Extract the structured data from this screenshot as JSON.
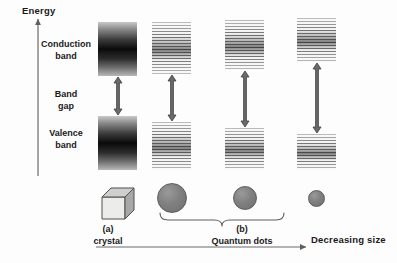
{
  "figure": {
    "background_color": "#fdfdfd",
    "width": 397,
    "height": 263
  },
  "axes": {
    "y_axis": {
      "label": "Energy",
      "direction": "up",
      "x": 38,
      "top": 18,
      "bottom": 176
    },
    "x_axis": {
      "label": "Decreasing size",
      "direction": "right",
      "y": 247,
      "left": 96,
      "right": 308
    }
  },
  "labels": {
    "conduction_band": "Conduction\nband",
    "conduction_band_line1": "Conduction",
    "conduction_band_line2": "band",
    "band_gap_line1": "Band",
    "band_gap_line2": "gap",
    "valence_band_line1": "Valence",
    "valence_band_line2": "band"
  },
  "captions": {
    "a_tag": "(a)",
    "a_text": "crystal",
    "b_tag": "(b)",
    "b_text": "Quantum dots"
  },
  "colors": {
    "band_dark": "#0a0a0a",
    "band_light": "#c9c9c9",
    "quantised_line": "#6f6f6f",
    "arrow": "#5a5a5a",
    "dot_fill": "#7b7b7b",
    "axis": "#6b6b6b",
    "text": "#1a1a1a"
  },
  "chart_data": {
    "type": "diagram",
    "xlabel": "Decreasing size",
    "ylabel": "Energy",
    "columns": [
      {
        "id": "crystal",
        "kind": "bulk-crystal",
        "caption_tag": "(a)",
        "caption_text": "crystal",
        "band_style": "continuous",
        "specimen": "cube",
        "specimen_size_px": 30,
        "conduction_band": {
          "x": 98,
          "y": 22,
          "width": 39,
          "height": 54
        },
        "valence_band": {
          "x": 98,
          "y": 116,
          "width": 39,
          "height": 54
        },
        "band_gap": {
          "top": 76,
          "bottom": 116,
          "height": 40,
          "relative": 1.0
        }
      },
      {
        "id": "qd-large",
        "kind": "quantum-dot",
        "band_style": "quantised",
        "specimen": "circle",
        "specimen_size_px": 30,
        "conduction_band": {
          "x": 152,
          "y": 22,
          "width": 39,
          "height": 52
        },
        "valence_band": {
          "x": 152,
          "y": 122,
          "width": 39,
          "height": 48
        },
        "band_gap": {
          "top": 74,
          "bottom": 122,
          "height": 48,
          "relative": 1.2
        }
      },
      {
        "id": "qd-medium",
        "kind": "quantum-dot",
        "band_style": "quantised",
        "specimen": "circle",
        "specimen_size_px": 24,
        "conduction_band": {
          "x": 225,
          "y": 20,
          "width": 39,
          "height": 50
        },
        "valence_band": {
          "x": 225,
          "y": 128,
          "width": 39,
          "height": 42
        },
        "band_gap": {
          "top": 70,
          "bottom": 128,
          "height": 58,
          "relative": 1.45
        }
      },
      {
        "id": "qd-small",
        "kind": "quantum-dot",
        "band_style": "quantised",
        "specimen": "circle",
        "specimen_size_px": 17,
        "conduction_band": {
          "x": 297,
          "y": 18,
          "width": 39,
          "height": 44
        },
        "valence_band": {
          "x": 297,
          "y": 134,
          "width": 39,
          "height": 36
        },
        "band_gap": {
          "top": 62,
          "bottom": 134,
          "height": 72,
          "relative": 1.8
        }
      }
    ],
    "note": "Band gap widens and particle size shrinks from left to right; bulk crystal bands are continuous while quantum dot bands are discretised into levels."
  }
}
